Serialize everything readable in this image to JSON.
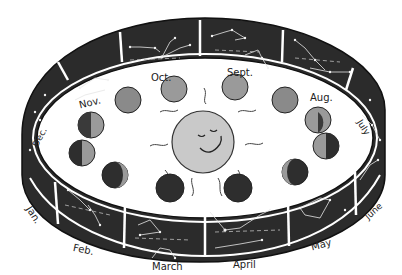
{
  "diagram": {
    "center": {
      "object": "sun",
      "face": "smiling sun with closed eyes",
      "fill": "#c9c9c9"
    },
    "colors": {
      "band": "#2b2b2b",
      "earth_light": "#9a9a9a",
      "earth_dark": "#2e2e2e",
      "sun": "#c9c9c9"
    },
    "months": [
      {
        "id": "jan",
        "label": "Jan."
      },
      {
        "id": "feb",
        "label": "Feb."
      },
      {
        "id": "mar",
        "label": "March"
      },
      {
        "id": "apr",
        "label": "April"
      },
      {
        "id": "may",
        "label": "May"
      },
      {
        "id": "jun",
        "label": "June"
      },
      {
        "id": "jul",
        "label": "July"
      },
      {
        "id": "aug",
        "label": "Aug."
      },
      {
        "id": "sep",
        "label": "Sept."
      },
      {
        "id": "oct",
        "label": "Oct."
      },
      {
        "id": "nov",
        "label": "Nov."
      },
      {
        "id": "dec",
        "label": "Dec."
      }
    ],
    "earth_positions": 12,
    "constellation_panels": 12
  }
}
